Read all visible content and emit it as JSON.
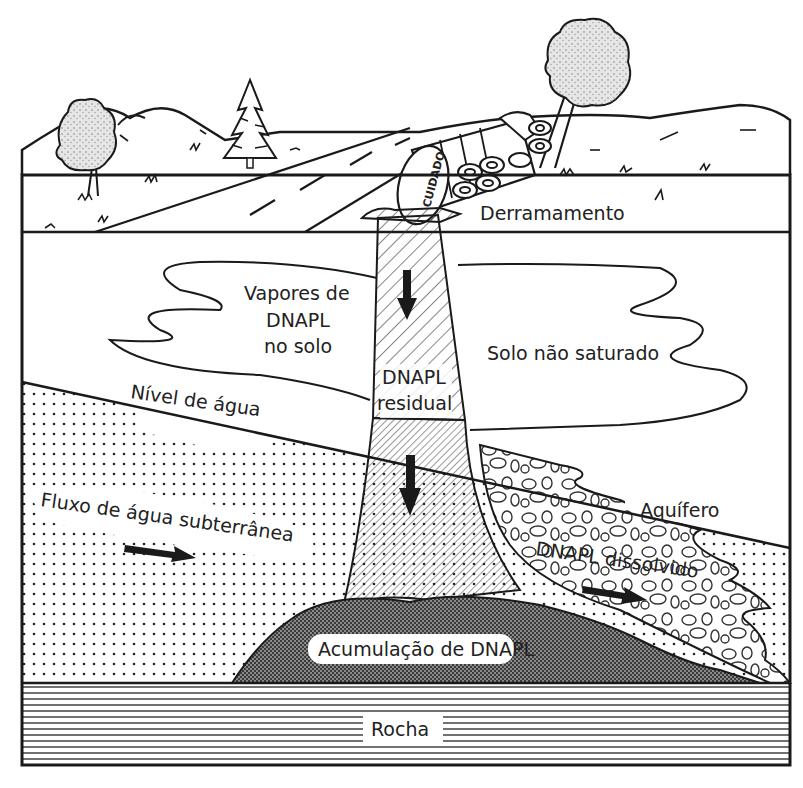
{
  "diagram": {
    "language": "pt",
    "labels": {
      "spill": "Derramamento",
      "tank_warning": "CUIDADO",
      "soil_vapors_line1": "Vapores de",
      "soil_vapors_line2": "DNAPL",
      "soil_vapors_line3": "no solo",
      "residual_line1": "DNAPL",
      "residual_line2": "residual",
      "unsaturated_soil": "Solo não saturado",
      "water_table": "Nível de água",
      "groundwater_flow": "Fluxo de água subterrânea",
      "aquifer": "Aquífero",
      "dissolved": "DNAPL dissolvido",
      "pool": "Acumulação de DNAPL",
      "bedrock": "Rocha"
    },
    "layers": [
      {
        "name": "surface",
        "description": "landscape with hills, trees, road and overturned tanker truck"
      },
      {
        "name": "unsaturated-zone",
        "label_ref": "unsaturated_soil"
      },
      {
        "name": "saturated-zone",
        "label_ref": "aquifer"
      },
      {
        "name": "bedrock",
        "label_ref": "bedrock"
      }
    ],
    "colors": {
      "ink": "#1a1a1a",
      "background": "#ffffff",
      "pool_fill": "#6e6e6e",
      "text": "#222222"
    }
  }
}
